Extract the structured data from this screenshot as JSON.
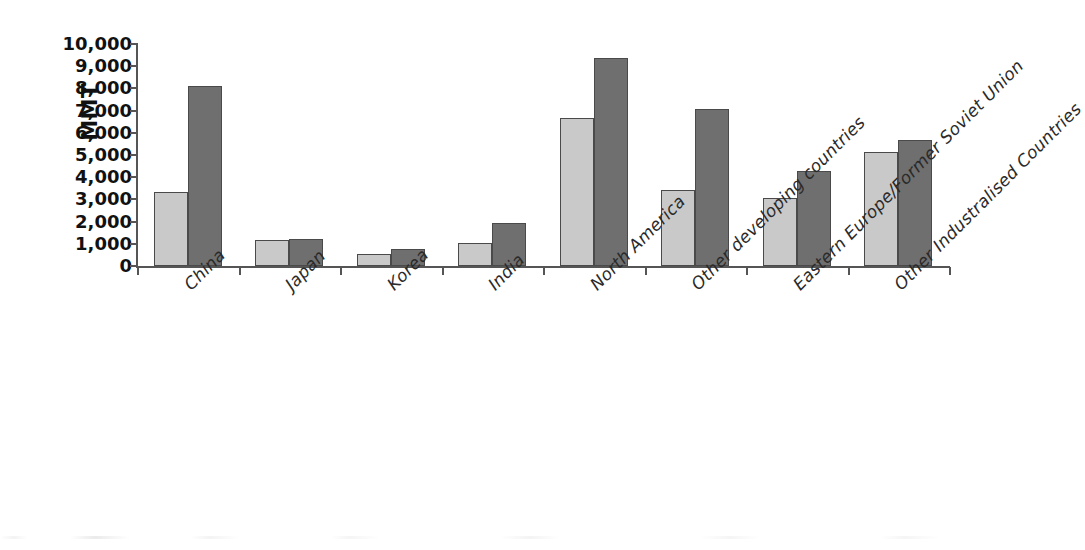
{
  "chart_data": {
    "type": "bar",
    "title": "",
    "subtitle": "",
    "xlabel": "",
    "ylabel": "MMT",
    "ylim": [
      0,
      10000
    ],
    "grid": false,
    "legend_position": "none",
    "orientation": "vertical",
    "bar_mode": "grouped",
    "categories": [
      "China",
      "Japan",
      "Korea",
      "India",
      "North America",
      "Other developing countries",
      "Eastern Europe/Former Soviet Union",
      "Other Industralised Countries"
    ],
    "series": [
      {
        "name": "series-1",
        "color": "#c9c9c9",
        "values": [
          3350,
          1180,
          540,
          1020,
          6680,
          3420,
          3080,
          5130
        ]
      },
      {
        "name": "series-2",
        "color": "#6f6f6f",
        "values": [
          8120,
          1230,
          760,
          1950,
          9370,
          7080,
          4280,
          5690
        ]
      }
    ],
    "y_ticks": [
      0,
      1000,
      2000,
      3000,
      4000,
      5000,
      6000,
      7000,
      8000,
      9000,
      10000
    ],
    "y_tick_labels": [
      "0",
      "1,000",
      "2,000",
      "3,000",
      "4,000",
      "5,000",
      "6,000",
      "7,000",
      "8,000",
      "9,000",
      "10,000"
    ],
    "x_tick_labels": [
      "China",
      "Japan",
      "Korea",
      "India",
      "North America",
      "Other developing countries",
      "Eastern Europe/Former Soviet Union",
      "Other Industralised Countries"
    ],
    "x_label_rotation": -45,
    "axis_color": "#555555",
    "bar_edge_color": "#4a4a4a",
    "background_color": "#ffffff",
    "text_color": "#1a1a1a"
  }
}
